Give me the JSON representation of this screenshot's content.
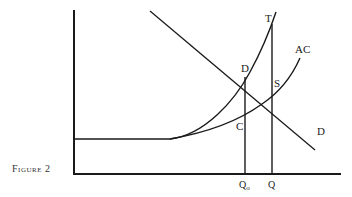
{
  "figure": {
    "caption": "Figure 2"
  },
  "diagram": {
    "type": "economics-cost-curves",
    "axes": {
      "origin": [
        74,
        174
      ],
      "y_axis_top": 10,
      "x_axis_right": 341
    },
    "curves": {
      "T": {
        "label": "T",
        "description": "marginal cost curve"
      },
      "AC": {
        "label": "AC",
        "description": "average cost curve"
      },
      "D": {
        "label": "D",
        "description": "demand curve"
      }
    },
    "points": {
      "D": {
        "label": "D"
      },
      "S": {
        "label": "S"
      },
      "C": {
        "label": "C"
      }
    },
    "x_ticks": {
      "Q0": {
        "label": "Q",
        "sub": "o"
      },
      "Q": {
        "label": "Q"
      }
    }
  },
  "colors": {
    "line": "#1a1a1a",
    "background": "#ffffff"
  }
}
